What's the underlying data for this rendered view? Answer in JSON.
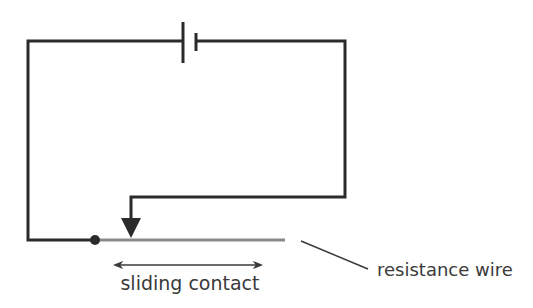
{
  "diagram": {
    "type": "circuit",
    "components": {
      "battery": {
        "name": "cell"
      },
      "resistance_wire": {
        "name": "resistance wire"
      },
      "sliding_contact": {
        "name": "sliding contact"
      },
      "junction_dot": {
        "name": "fixed contact"
      }
    },
    "labels": {
      "sliding_contact": "sliding contact",
      "resistance_wire": "resistance wire"
    },
    "colors": {
      "wire": "#2b2b2b",
      "resistance_wire": "#8a8a8a",
      "text": "#3a3a3a",
      "background": "#ffffff"
    }
  }
}
